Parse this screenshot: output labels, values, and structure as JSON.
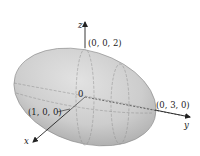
{
  "figure": {
    "type": "ellipsoid",
    "labels": {
      "z_axis": "z",
      "y_axis": "y",
      "x_axis": "x",
      "origin": "0",
      "point_z": "(0, 0, 2)",
      "point_y": "(0, 3, 0)",
      "point_x": "(1, 0, 0)"
    },
    "colors": {
      "surface_light": "#e4e4e4",
      "surface_dark": "#a8a8a8",
      "outline": "#8a8a8a",
      "grid": "#8c8c8c",
      "axis": "#222222"
    }
  }
}
